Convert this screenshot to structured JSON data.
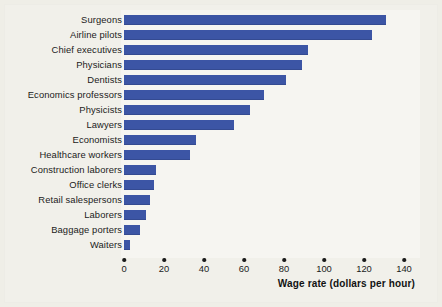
{
  "chart_data": {
    "type": "bar",
    "orientation": "horizontal",
    "title": "",
    "xlabel": "Wage rate (dollars per hour)",
    "ylabel": "",
    "xlim": [
      0,
      140
    ],
    "xticks": [
      0,
      20,
      40,
      60,
      80,
      100,
      120,
      140
    ],
    "grid": false,
    "legend": null,
    "bar_color": "#3c55a5",
    "background_color": "#efeee7",
    "plot_background_color": "#f6f5f1",
    "categories": [
      "Surgeons",
      "Airline pilots",
      "Chief executives",
      "Physicians",
      "Dentists",
      "Economics professors",
      "Physicists",
      "Lawyers",
      "Economists",
      "Healthcare workers",
      "Construction laborers",
      "Office clerks",
      "Retail salespersons",
      "Laborers",
      "Baggage porters",
      "Waiters"
    ],
    "values": [
      131,
      124,
      92,
      89,
      81,
      70,
      63,
      55,
      36,
      33,
      16,
      15,
      13,
      11,
      8,
      3
    ],
    "units": "dollars per hour"
  },
  "axis": {
    "title": "Wage rate (dollars per hour)",
    "tick_labels": [
      "0",
      "20",
      "40",
      "60",
      "80",
      "100",
      "120",
      "140"
    ]
  }
}
